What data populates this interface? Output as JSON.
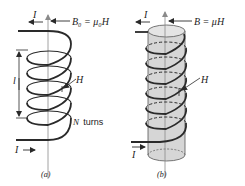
{
  "figure": {
    "panel_a": {
      "caption": "(a)",
      "field_label": "B₀ = μ₀H",
      "current_top_label": "I",
      "current_bottom_label": "I",
      "length_label": "l",
      "H_label": "H",
      "turns_label_N": "N",
      "turns_label_word": "turns"
    },
    "panel_b": {
      "caption": "(b)",
      "field_label": "B = μH",
      "current_top_label": "I",
      "current_bottom_label": "I",
      "H_label": "H"
    },
    "colors": {
      "wire": "#2a2a2a",
      "core_fill": "#d6d6d6",
      "axis": "#8a8a8a",
      "text": "#222222"
    }
  }
}
